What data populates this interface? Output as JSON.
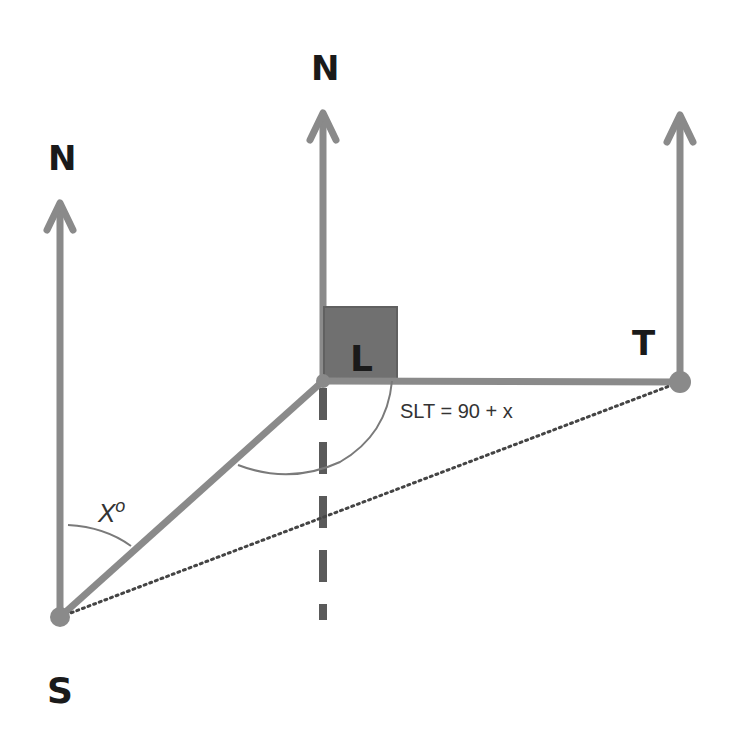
{
  "diagram": {
    "type": "bearing-geometry",
    "colors": {
      "line": "#8a8a8a",
      "box": "#6e6e6e",
      "dashed": "#5a5a5a",
      "text": "#1a1a1a",
      "arc": "#7a7a7a",
      "dotted": "#444444"
    },
    "points": {
      "S": {
        "label": "S",
        "x": 60,
        "y": 617
      },
      "L": {
        "label": "L",
        "x": 323,
        "y": 381
      },
      "T": {
        "label": "T",
        "x": 680,
        "y": 382
      }
    },
    "north_arrows": [
      {
        "id": "north-S",
        "label": "N",
        "x": 60,
        "top": 200,
        "bottom": 617
      },
      {
        "id": "north-L",
        "label": "N",
        "x": 323,
        "top": 110,
        "bottom": 381
      },
      {
        "id": "north-T",
        "label": "",
        "x": 680,
        "top": 112,
        "bottom": 382
      }
    ],
    "labels": {
      "north_s": "N",
      "north_l": "N",
      "point_s": "S",
      "point_l": "L",
      "point_t": "T",
      "angle_x": "X°",
      "angle_x_main": "X",
      "angle_x_deg": "o",
      "angle_slt": "SLT = 90 + x"
    }
  }
}
